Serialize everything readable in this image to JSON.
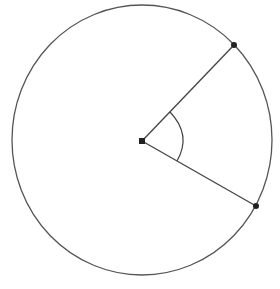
{
  "diagram": {
    "title": "",
    "colors": {
      "stroke": "#444444",
      "background": "#ffffff",
      "point": "#222222"
    },
    "circle": {
      "cx": 142,
      "cy": 140,
      "rx": 130,
      "ry": 135
    },
    "center_point": {
      "x": 142,
      "y": 141
    },
    "radius_points": [
      {
        "x": 234,
        "y": 45
      },
      {
        "x": 256,
        "y": 206
      }
    ],
    "angle_arc": {
      "radius": 40,
      "label": ""
    }
  }
}
